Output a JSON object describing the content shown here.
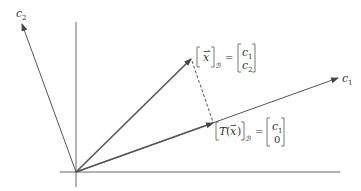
{
  "diagram": {
    "type": "vector-projection-coordinate-system",
    "colors": {
      "axis": "#555555",
      "vector": "#555555",
      "label": "#333333",
      "background": "#ffffff"
    },
    "axes": {
      "c1": {
        "label": "c",
        "subscript": "1"
      },
      "c2": {
        "label": "c",
        "subscript": "2"
      }
    },
    "vector_x_label": {
      "lhs_var": "x",
      "lhs_sub": "ℬ",
      "equals": "=",
      "matrix": [
        "c",
        "c"
      ],
      "matrix_subs": [
        "1",
        "2"
      ]
    },
    "vector_Tx_label": {
      "lhs_fn": "T",
      "lhs_var": "x",
      "lhs_sub": "ℬ",
      "equals": "=",
      "matrix_top": "c",
      "matrix_top_sub": "1",
      "matrix_bottom": "0"
    }
  }
}
